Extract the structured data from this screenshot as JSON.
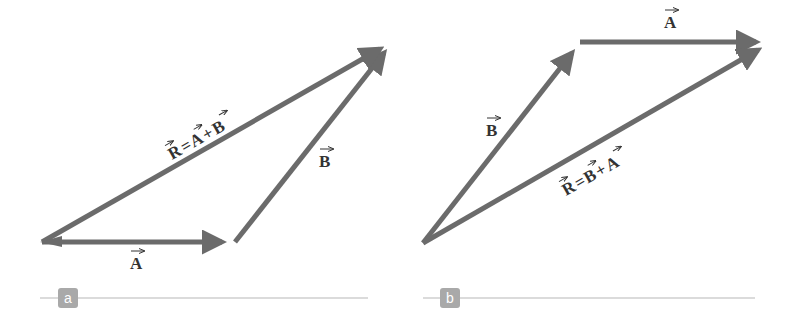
{
  "colors": {
    "vector": "#6b6b6b",
    "text": "#333333",
    "badge_bg": "#a9a9a9",
    "rule": "#cfcfcf"
  },
  "panels": [
    {
      "id": "a",
      "badge_label": "a",
      "vectors": [
        {
          "name": "A",
          "label": "A",
          "from": [
            42,
            242
          ],
          "to": [
            235,
            242
          ]
        },
        {
          "name": "B",
          "label": "B",
          "from": [
            235,
            242
          ],
          "to": [
            392,
            42
          ]
        },
        {
          "name": "R",
          "label": "R = A + B",
          "from": [
            42,
            242
          ],
          "to": [
            392,
            42
          ]
        }
      ],
      "equation": {
        "lhs": "R",
        "eq": "=",
        "t1": "A",
        "op": "+",
        "t2": "B"
      }
    },
    {
      "id": "b",
      "badge_label": "b",
      "vectors": [
        {
          "name": "B",
          "label": "B",
          "from": [
            423,
            243
          ],
          "to": [
            580,
            42
          ]
        },
        {
          "name": "A",
          "label": "A",
          "from": [
            580,
            42
          ],
          "to": [
            769,
            42
          ]
        },
        {
          "name": "R",
          "label": "R = B + A",
          "from": [
            423,
            243
          ],
          "to": [
            769,
            42
          ]
        }
      ],
      "equation": {
        "lhs": "R",
        "eq": "=",
        "t1": "B",
        "op": "+",
        "t2": "A"
      }
    }
  ]
}
